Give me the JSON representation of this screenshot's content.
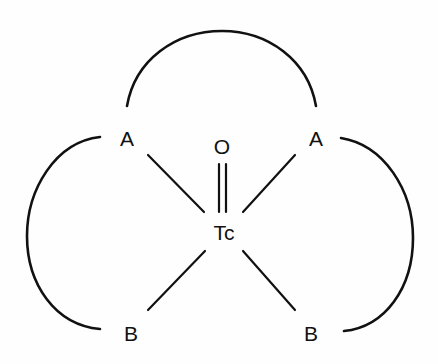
{
  "diagram": {
    "background_color": "#ffffff",
    "line_color": "#111111",
    "atoms": {
      "center": "Tc",
      "oxo": "O",
      "top_left": "A",
      "top_right": "A",
      "bottom_left": "B",
      "bottom_right": "B"
    },
    "bonds": [
      {
        "from": "Tc",
        "to": "O",
        "order": 2
      },
      {
        "from": "Tc",
        "to": "A (top-left)",
        "order": 1
      },
      {
        "from": "Tc",
        "to": "A (top-right)",
        "order": 1
      },
      {
        "from": "Tc",
        "to": "B (bottom-left)",
        "order": 1
      },
      {
        "from": "Tc",
        "to": "B (bottom-right)",
        "order": 1
      }
    ],
    "linkers": [
      {
        "connects": [
          "A (top-left)",
          "A (top-right)"
        ],
        "shape": "arc-top"
      },
      {
        "connects": [
          "A (top-left)",
          "B (bottom-left)"
        ],
        "shape": "arc-left"
      },
      {
        "connects": [
          "A (top-right)",
          "B (bottom-right)"
        ],
        "shape": "arc-right"
      }
    ]
  }
}
